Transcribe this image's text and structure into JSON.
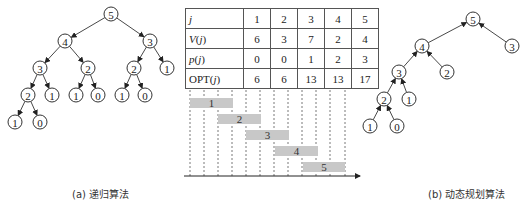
{
  "table": {
    "rows": [
      {
        "header": "j",
        "values": [
          "1",
          "2",
          "3",
          "4",
          "5"
        ]
      },
      {
        "header": "V(j)",
        "values": [
          "6",
          "3",
          "7",
          "2",
          "4"
        ]
      },
      {
        "header": "p(j)",
        "values": [
          "0",
          "0",
          "1",
          "2",
          "3"
        ]
      },
      {
        "header": "OPT(j)",
        "values": [
          "6",
          "6",
          "13",
          "13",
          "17"
        ]
      }
    ]
  },
  "tree_a": {
    "nodes": [
      {
        "label": "5",
        "x": 111,
        "y": 14
      },
      {
        "label": "4",
        "x": 65,
        "y": 41
      },
      {
        "label": "3",
        "x": 150,
        "y": 41
      },
      {
        "label": "3",
        "x": 40,
        "y": 68
      },
      {
        "label": "2",
        "x": 88,
        "y": 68
      },
      {
        "label": "2",
        "x": 134,
        "y": 68
      },
      {
        "label": "1",
        "x": 167,
        "y": 68
      },
      {
        "label": "2",
        "x": 28,
        "y": 95
      },
      {
        "label": "1",
        "x": 52,
        "y": 95
      },
      {
        "label": "1",
        "x": 76,
        "y": 95
      },
      {
        "label": "0",
        "x": 98,
        "y": 95
      },
      {
        "label": "1",
        "x": 122,
        "y": 95
      },
      {
        "label": "0",
        "x": 145,
        "y": 95
      },
      {
        "label": "1",
        "x": 15,
        "y": 122
      },
      {
        "label": "0",
        "x": 40,
        "y": 122
      }
    ],
    "edges": [
      [
        0,
        1
      ],
      [
        0,
        2
      ],
      [
        1,
        3
      ],
      [
        1,
        4
      ],
      [
        2,
        5
      ],
      [
        2,
        6
      ],
      [
        3,
        7
      ],
      [
        3,
        8
      ],
      [
        4,
        9
      ],
      [
        4,
        10
      ],
      [
        5,
        11
      ],
      [
        5,
        12
      ],
      [
        7,
        13
      ],
      [
        7,
        14
      ]
    ],
    "arrow_direction": "parent-to-child"
  },
  "tree_b": {
    "nodes": [
      {
        "label": "5",
        "x": 473,
        "y": 19
      },
      {
        "label": "4",
        "x": 422,
        "y": 46
      },
      {
        "label": "3",
        "x": 512,
        "y": 46
      },
      {
        "label": "3",
        "x": 399,
        "y": 72
      },
      {
        "label": "2",
        "x": 447,
        "y": 72
      },
      {
        "label": "2",
        "x": 384,
        "y": 99
      },
      {
        "label": "1",
        "x": 409,
        "y": 99
      },
      {
        "label": "1",
        "x": 370,
        "y": 126
      },
      {
        "label": "0",
        "x": 397,
        "y": 126
      }
    ],
    "edges": [
      [
        0,
        1
      ],
      [
        0,
        2
      ],
      [
        1,
        3
      ],
      [
        1,
        4
      ],
      [
        3,
        5
      ],
      [
        3,
        6
      ],
      [
        5,
        7
      ],
      [
        5,
        8
      ]
    ],
    "arrow_direction": "child-to-parent"
  },
  "intervals": {
    "dashed_lines_x": [
      190,
      204,
      218,
      232,
      246,
      260,
      274,
      288,
      302,
      316,
      330,
      345
    ],
    "bars": [
      {
        "label": "1",
        "x1": 190,
        "x2": 233,
        "y": 98
      },
      {
        "label": "2",
        "x1": 218,
        "x2": 261,
        "y": 114
      },
      {
        "label": "3",
        "x1": 246,
        "x2": 289,
        "y": 130
      },
      {
        "label": "4",
        "x1": 275,
        "x2": 318,
        "y": 146
      },
      {
        "label": "5",
        "x1": 303,
        "x2": 345,
        "y": 162
      }
    ],
    "axis_y": 176,
    "axis_x1": 184,
    "axis_x2": 360
  },
  "captions": {
    "a": "(a) 递归算法",
    "b": "(b) 动态规划算法"
  },
  "colors": {
    "bar_fill": "#c8c8c8",
    "stroke": "#333333"
  }
}
